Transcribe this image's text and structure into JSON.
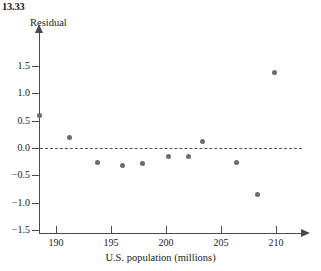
{
  "exercise": {
    "number": "13.33"
  },
  "chart_data": {
    "type": "scatter",
    "title": "",
    "xlabel": "U.S. population (millions)",
    "ylabel": "Residual",
    "xlim": [
      187.5,
      211.5
    ],
    "ylim": [
      -1.65,
      1.8
    ],
    "grid": false,
    "legend": null,
    "reference_line": {
      "y": 0.0,
      "style": "dashed"
    },
    "xticks": [
      190,
      195,
      200,
      205,
      210
    ],
    "xtick_labels": [
      "190",
      "195",
      "200",
      "205",
      "210"
    ],
    "yticks": [
      1.5,
      1.0,
      0.5,
      0.0,
      -0.5,
      -1.0,
      -1.5
    ],
    "ytick_labels": [
      "1.5",
      "1.0",
      "0.5",
      "0.0",
      "−0.5",
      "−1.0",
      "−1.5"
    ],
    "point_color": "#6b6b6b",
    "axis_color": "#4a4a4a",
    "x": [
      188.5,
      191.2,
      193.8,
      196.0,
      197.9,
      200.2,
      202.0,
      203.3,
      206.4,
      208.3,
      209.9
    ],
    "y": [
      0.6,
      0.2,
      -0.27,
      -0.32,
      -0.29,
      -0.16,
      -0.15,
      0.12,
      -0.27,
      -0.85,
      1.39
    ],
    "points": [
      {
        "x": 188.5,
        "y": 0.6
      },
      {
        "x": 191.2,
        "y": 0.2
      },
      {
        "x": 193.8,
        "y": -0.27
      },
      {
        "x": 196.0,
        "y": -0.32
      },
      {
        "x": 197.9,
        "y": -0.29
      },
      {
        "x": 200.2,
        "y": -0.16
      },
      {
        "x": 202.0,
        "y": -0.15
      },
      {
        "x": 203.3,
        "y": 0.12
      },
      {
        "x": 206.4,
        "y": -0.27
      },
      {
        "x": 208.3,
        "y": -0.85
      },
      {
        "x": 209.9,
        "y": 1.39
      }
    ]
  }
}
